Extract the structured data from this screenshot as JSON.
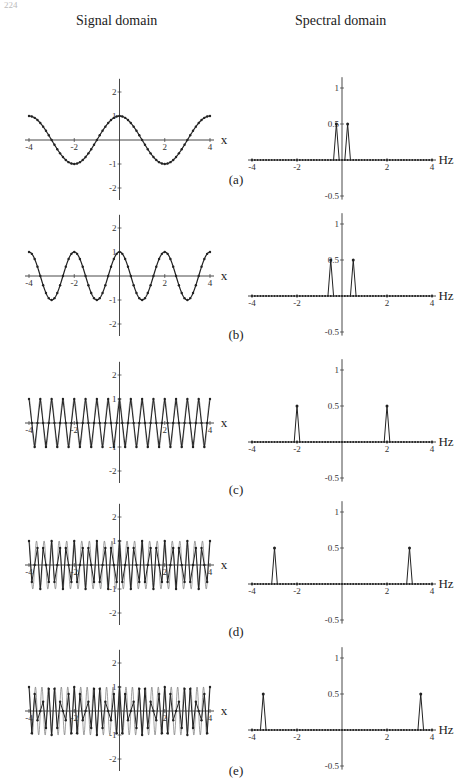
{
  "page": {
    "number": "224"
  },
  "headers": {
    "left": "Signal domain",
    "right": "Spectral domain"
  },
  "chart_data": [
    {
      "panel": "(a)",
      "type": "line",
      "side": "signal",
      "title": "Signal domain",
      "xlabel": "x",
      "xlim": [
        -4,
        4
      ],
      "ylim": [
        -2.5,
        2.5
      ],
      "xticks": [
        -4,
        -2,
        2,
        4
      ],
      "yticks": [
        2,
        1,
        -1,
        -2
      ],
      "freq": 0.25,
      "samples_per_unit": 8,
      "caption": "(a)"
    },
    {
      "panel": "(a)",
      "type": "line",
      "side": "spectral",
      "title": "Spectral domain",
      "xlabel": "Hz",
      "xlim": [
        -4,
        4
      ],
      "ylim": [
        -0.5,
        1.1
      ],
      "xticks": [
        -4,
        -2,
        2,
        4
      ],
      "yticks": [
        1,
        0.5,
        -0.5
      ],
      "peaks": [
        {
          "x": -0.25,
          "y": 0.5
        },
        {
          "x": 0.25,
          "y": 0.5
        }
      ]
    },
    {
      "panel": "(b)",
      "type": "line",
      "side": "signal",
      "xlabel": "x",
      "xlim": [
        -4,
        4
      ],
      "ylim": [
        -2.5,
        2.5
      ],
      "xticks": [
        -4,
        -2,
        2,
        4
      ],
      "yticks": [
        2,
        1,
        -1,
        -2
      ],
      "freq": 0.5,
      "samples_per_unit": 8,
      "caption": "(b)"
    },
    {
      "panel": "(b)",
      "type": "line",
      "side": "spectral",
      "xlabel": "Hz",
      "xlim": [
        -4,
        4
      ],
      "ylim": [
        -0.5,
        1.1
      ],
      "xticks": [
        -4,
        -2,
        2,
        4
      ],
      "yticks": [
        1,
        0.5,
        -0.5
      ],
      "peaks": [
        {
          "x": -0.5,
          "y": 0.5
        },
        {
          "x": 0.5,
          "y": 0.5
        }
      ]
    },
    {
      "panel": "(c)",
      "type": "line",
      "side": "signal",
      "xlabel": "x",
      "xlim": [
        -4,
        4
      ],
      "ylim": [
        -2.5,
        2.5
      ],
      "xticks": [
        -4,
        -2,
        2,
        4
      ],
      "yticks": [
        2,
        1,
        -1,
        -2
      ],
      "freq": 2,
      "samples_per_unit": 8,
      "caption": "(c)"
    },
    {
      "panel": "(c)",
      "type": "line",
      "side": "spectral",
      "xlabel": "Hz",
      "xlim": [
        -4,
        4
      ],
      "ylim": [
        -0.5,
        1.1
      ],
      "xticks": [
        -4,
        -2,
        2,
        4
      ],
      "yticks": [
        1,
        0.5,
        -0.5
      ],
      "peaks": [
        {
          "x": -2,
          "y": 0.5
        },
        {
          "x": 2,
          "y": 0.5
        }
      ]
    },
    {
      "panel": "(d)",
      "type": "line",
      "side": "signal",
      "xlabel": "x",
      "xlim": [
        -4,
        4
      ],
      "ylim": [
        -2.5,
        2.5
      ],
      "xticks": [
        -4,
        -2,
        2,
        4
      ],
      "yticks": [
        2,
        1,
        -1,
        -2
      ],
      "freq": 3,
      "samples_per_unit": 8,
      "caption": "(d)"
    },
    {
      "panel": "(d)",
      "type": "line",
      "side": "spectral",
      "xlabel": "Hz",
      "xlim": [
        -4,
        4
      ],
      "ylim": [
        -0.5,
        1.1
      ],
      "xticks": [
        -4,
        -2,
        2,
        4
      ],
      "yticks": [
        1,
        0.5,
        -0.5
      ],
      "peaks": [
        {
          "x": -3,
          "y": 0.5
        },
        {
          "x": 3,
          "y": 0.5
        }
      ]
    },
    {
      "panel": "(e)",
      "type": "line",
      "side": "signal",
      "xlabel": "x",
      "xlim": [
        -4,
        4
      ],
      "ylim": [
        -2.5,
        2.5
      ],
      "xticks": [
        -4,
        -2,
        2,
        4
      ],
      "yticks": [
        2,
        1,
        -1,
        -2
      ],
      "freq": 3.5,
      "samples_per_unit": 8,
      "caption": "(e)"
    },
    {
      "panel": "(e)",
      "type": "line",
      "side": "spectral",
      "xlabel": "Hz",
      "xlim": [
        -4,
        4
      ],
      "ylim": [
        -0.5,
        1.1
      ],
      "xticks": [
        -4,
        -2,
        2,
        4
      ],
      "yticks": [
        1,
        0.5,
        -0.5
      ],
      "peaks": [
        {
          "x": -3.5,
          "y": 0.5
        },
        {
          "x": 3.5,
          "y": 0.5
        }
      ]
    }
  ],
  "layout": {
    "rows": [
      {
        "top": 40,
        "caption_y": 184
      },
      {
        "top": 188,
        "caption_y": 339
      },
      {
        "top": 342,
        "caption_y": 494
      },
      {
        "top": 496,
        "caption_y": 636
      },
      {
        "top": 640,
        "caption_y": 775
      }
    ]
  }
}
